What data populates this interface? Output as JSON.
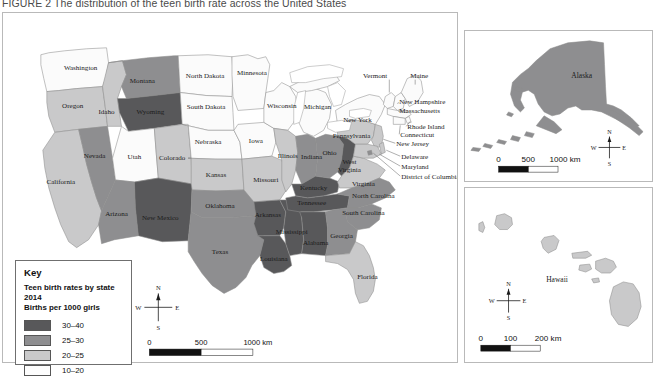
{
  "figure": {
    "caption": "FIGURE 2 The distribution of the teen birth rate across the United States"
  },
  "legend": {
    "title": "Key",
    "subtitle_line1": "Teen birth rates by state 2014",
    "subtitle_line2": "Births per 1000 girls",
    "classes": [
      {
        "label": "30–40",
        "color": "#58585a"
      },
      {
        "label": "25–30",
        "color": "#8e8e90"
      },
      {
        "label": "20–25",
        "color": "#c9c9ca"
      },
      {
        "label": "10–20",
        "color": "#fbfbfb"
      }
    ]
  },
  "compass": {
    "north": "N",
    "south": "S",
    "east": "E",
    "west": "W"
  },
  "scalebars": {
    "main": {
      "ticks": [
        "0",
        "500",
        "1000 km"
      ]
    },
    "alaska": {
      "ticks": [
        "0",
        "500",
        "1000 km"
      ]
    },
    "hawaii": {
      "ticks": [
        "0",
        "100",
        "200 km"
      ]
    }
  },
  "insets": {
    "alaska": {
      "label": "Alaska"
    },
    "hawaii": {
      "label": "Hawaii"
    }
  },
  "map_data": {
    "type": "choropleth",
    "title": "Teen birth rates by state 2014",
    "unit": "Births per 1000 girls",
    "year": 2014,
    "classes": [
      "10–20",
      "20–25",
      "25–30",
      "30–40"
    ],
    "states": [
      {
        "name": "Washington",
        "class": "10–20",
        "label_x": 78,
        "label_y": 57
      },
      {
        "name": "Oregon",
        "class": "20–25",
        "label_x": 52,
        "label_y": 93
      },
      {
        "name": "California",
        "class": "20–25",
        "label_x": 45,
        "label_y": 164
      },
      {
        "name": "Nevada",
        "class": "25–30",
        "label_x": 74,
        "label_y": 142
      },
      {
        "name": "Idaho",
        "class": "20–25",
        "label_x": 101,
        "label_y": 101
      },
      {
        "name": "Montana",
        "class": "25–30",
        "label_x": 138,
        "label_y": 73
      },
      {
        "name": "Wyoming",
        "class": "30–40",
        "label_x": 138,
        "label_y": 119
      },
      {
        "name": "Utah",
        "class": "10–20",
        "label_x": 108,
        "label_y": 155
      },
      {
        "name": "Colorado",
        "class": "20–25",
        "label_x": 152,
        "label_y": 158
      },
      {
        "name": "Arizona",
        "class": "25–30",
        "label_x": 102,
        "label_y": 207
      },
      {
        "name": "New Mexico",
        "class": "30–40",
        "label_x": 146,
        "label_y": 211
      },
      {
        "name": "North Dakota",
        "class": "10–20",
        "label_x": 196,
        "label_y": 76
      },
      {
        "name": "South Dakota",
        "class": "10–20",
        "label_x": 196,
        "label_y": 107
      },
      {
        "name": "Nebraska",
        "class": "10–20",
        "label_x": 197,
        "label_y": 136
      },
      {
        "name": "Kansas",
        "class": "20–25",
        "label_x": 208,
        "label_y": 168
      },
      {
        "name": "Oklahoma",
        "class": "25–30",
        "label_x": 212,
        "label_y": 199
      },
      {
        "name": "Texas",
        "class": "25–30",
        "label_x": 208,
        "label_y": 241
      },
      {
        "name": "Minnesota",
        "class": "10–20",
        "label_x": 243,
        "label_y": 75
      },
      {
        "name": "Iowa",
        "class": "10–20",
        "label_x": 254,
        "label_y": 132
      },
      {
        "name": "Missouri",
        "class": "20–25",
        "label_x": 264,
        "label_y": 172
      },
      {
        "name": "Arkansas",
        "class": "30–40",
        "label_x": 259,
        "label_y": 207
      },
      {
        "name": "Louisiana",
        "class": "30–40",
        "label_x": 270,
        "label_y": 252
      },
      {
        "name": "Wisconsin",
        "class": "10–20",
        "label_x": 278,
        "label_y": 97
      },
      {
        "name": "Illinois",
        "class": "20–25",
        "label_x": 285,
        "label_y": 146
      },
      {
        "name": "Mississippi",
        "class": "30–40",
        "label_x": 288,
        "label_y": 225
      },
      {
        "name": "Michigan",
        "class": "10–20",
        "label_x": 314,
        "label_y": 98
      },
      {
        "name": "Indiana",
        "class": "25–30",
        "label_x": 307,
        "label_y": 154
      },
      {
        "name": "Kentucky",
        "class": "30–40",
        "label_x": 309,
        "label_y": 175
      },
      {
        "name": "Tennessee",
        "class": "30–40",
        "label_x": 306,
        "label_y": 193
      },
      {
        "name": "Alabama",
        "class": "30–40",
        "label_x": 315,
        "label_y": 238
      },
      {
        "name": "Ohio",
        "class": "25–30",
        "label_x": 327,
        "label_y": 144
      },
      {
        "name": "Georgia",
        "class": "25–30",
        "label_x": 340,
        "label_y": 227
      },
      {
        "name": "Florida",
        "class": "20–25",
        "label_x": 362,
        "label_y": 269
      },
      {
        "name": "South Carolina",
        "class": "25–30",
        "label_x": 352,
        "label_y": 205
      },
      {
        "name": "North Carolina",
        "class": "25–30",
        "label_x": 358,
        "label_y": 187
      },
      {
        "name": "West Virginia",
        "class": "30–40",
        "label_x": 339,
        "label_y": 160
      },
      {
        "name": "Virginia",
        "class": "20–25",
        "label_x": 352,
        "label_y": 170
      },
      {
        "name": "Pennsylvania",
        "class": "20–25",
        "label_x": 346,
        "label_y": 127
      },
      {
        "name": "New York",
        "class": "10–20",
        "label_x": 357,
        "label_y": 110
      },
      {
        "name": "Vermont",
        "class": "10–20",
        "label_x": 372,
        "label_y": 62
      },
      {
        "name": "Maine",
        "class": "10–20",
        "label_x": 414,
        "label_y": 62
      },
      {
        "name": "New Hampshire",
        "class": "10–20",
        "label_x": 400,
        "label_y": 92
      },
      {
        "name": "Massachusetts",
        "class": "10–20",
        "label_x": 400,
        "label_y": 101
      },
      {
        "name": "Rhode Island",
        "class": "10–20",
        "label_x": 408,
        "label_y": 117
      },
      {
        "name": "Connecticut",
        "class": "10–20",
        "label_x": 401,
        "label_y": 125
      },
      {
        "name": "New Jersey",
        "class": "20–25",
        "label_x": 397,
        "label_y": 134
      },
      {
        "name": "Delaware",
        "class": "20–25",
        "label_x": 402,
        "label_y": 147
      },
      {
        "name": "Maryland",
        "class": "20–25",
        "label_x": 402,
        "label_y": 157
      },
      {
        "name": "District of Columbia",
        "class": "25–30",
        "label_x": 402,
        "label_y": 167
      },
      {
        "name": "Alaska",
        "class": "25–30",
        "label_x": 0,
        "label_y": 0
      },
      {
        "name": "Hawaii",
        "class": "20–25",
        "label_x": 0,
        "label_y": 0
      }
    ]
  }
}
